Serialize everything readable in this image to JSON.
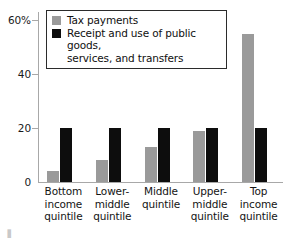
{
  "chart_data": {
    "type": "bar",
    "title": "",
    "xlabel": "",
    "ylabel": "",
    "ylim": [
      0,
      64.5
    ],
    "grid": false,
    "legend_position": "top-left",
    "categories": [
      "Bottom\nincome\nquintile",
      "Lower-\nmiddle\nquintile",
      "Middle\nquintile",
      "Upper-\nmiddle\nquintile",
      "Top\nincome\nquintile"
    ],
    "series": [
      {
        "name": "Tax payments",
        "color": "#9a9a9a",
        "values": [
          4,
          8,
          13,
          19,
          55
        ]
      },
      {
        "name": "Receipt and use of public goods,\nservices, and transfers",
        "color": "#0d0d0d",
        "values": [
          20,
          20,
          20,
          20,
          20
        ]
      }
    ],
    "y_ticks": [
      {
        "value": 60,
        "label": "60%"
      },
      {
        "value": 40,
        "label": "40"
      },
      {
        "value": 20,
        "label": "20"
      },
      {
        "value": 0,
        "label": "0"
      }
    ]
  },
  "axis": {
    "line_color": "#a8a8a8"
  },
  "artifact": {
    "text": "▐"
  }
}
